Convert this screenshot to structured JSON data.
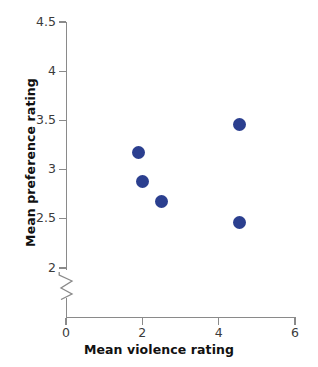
{
  "chart_data": {
    "type": "scatter",
    "title": "",
    "xlabel": "Mean violence rating",
    "ylabel": "Mean preference rating",
    "xlim": [
      0,
      6
    ],
    "ylim": [
      2,
      4.5
    ],
    "y_axis_break": true,
    "y_axis_break_note": "axis break between 0 and 2",
    "grid": false,
    "legend": null,
    "marker_color": "#2b3f8f",
    "axis_color": "#8a8a8a",
    "text_color": "#3b3b3b",
    "xticks": [
      {
        "value": 0,
        "label": "0"
      },
      {
        "value": 2,
        "label": "2"
      },
      {
        "value": 4,
        "label": "4"
      },
      {
        "value": 6,
        "label": "6"
      }
    ],
    "yticks": [
      {
        "value": 4.5,
        "label": "4.5"
      },
      {
        "value": 4.0,
        "label": "4"
      },
      {
        "value": 3.5,
        "label": "3.5"
      },
      {
        "value": 3.0,
        "label": "3"
      },
      {
        "value": 2.5,
        "label": "2.5"
      },
      {
        "value": 2.0,
        "label": "2"
      }
    ],
    "points": [
      {
        "x": 1.9,
        "y": 3.17
      },
      {
        "x": 2.0,
        "y": 2.88
      },
      {
        "x": 2.5,
        "y": 2.68
      },
      {
        "x": 4.55,
        "y": 3.46
      },
      {
        "x": 4.55,
        "y": 2.46
      }
    ]
  }
}
